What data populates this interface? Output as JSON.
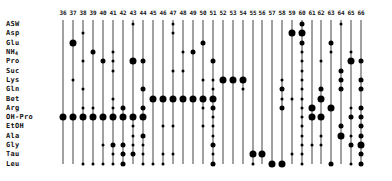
{
  "diagram": {
    "type": "dot-matrix",
    "columns": [
      "36",
      "37",
      "38",
      "39",
      "40",
      "41",
      "42",
      "43",
      "44",
      "45",
      "46",
      "47",
      "48",
      "49",
      "50",
      "51",
      "52",
      "53",
      "54",
      "55",
      "56",
      "57",
      "58",
      "59",
      "60",
      "61",
      "62",
      "63",
      "64",
      "65",
      "66"
    ],
    "rows": [
      "ASW",
      "Asp",
      "Glu",
      "NH4",
      "Pro",
      "Suc",
      "Lys",
      "Gln",
      "Bet",
      "Arg",
      "OH-Pro",
      "EtOH",
      "Ala",
      "Gly",
      "Tau",
      "Leu"
    ],
    "dot_size_legend": {
      "1": "trace",
      "2": "minor",
      "3": "major"
    },
    "dots": {
      "36": {
        "OH-Pro": 3
      },
      "37": {
        "Glu": 3,
        "Lys": 1,
        "OH-Pro": 3
      },
      "38": {
        "Asp": 1,
        "Pro": 1,
        "Gln": 1,
        "Arg": 1,
        "OH-Pro": 3,
        "Leu": 1
      },
      "39": {
        "NH4": 2,
        "Arg": 1,
        "OH-Pro": 3,
        "Leu": 1
      },
      "40": {
        "Pro": 2,
        "OH-Pro": 3,
        "Gly": 1,
        "Leu": 1
      },
      "41": {
        "NH4": 1,
        "Pro": 1,
        "Suc": 1,
        "Bet": 1,
        "Arg": 1,
        "OH-Pro": 3,
        "Gly": 2,
        "Tau": 1,
        "Leu": 1
      },
      "42": {
        "Arg": 2,
        "OH-Pro": 3,
        "Gly": 2,
        "Tau": 2,
        "Leu": 2
      },
      "43": {
        "ASW": 1,
        "Pro": 3,
        "OH-Pro": 3,
        "EtOH": 1,
        "Ala": 1,
        "Gly": 1,
        "Tau": 2
      },
      "44": {
        "Pro": 2,
        "Gln": 2,
        "Arg": 2,
        "OH-Pro": 3,
        "Ala": 2,
        "Gly": 1,
        "Tau": 1,
        "Leu": 1
      },
      "45": {
        "Bet": 3,
        "Leu": 1
      },
      "46": {
        "Bet": 3,
        "EtOH": 1,
        "Tau": 1,
        "Leu": 1
      },
      "47": {
        "ASW": 1,
        "Asp": 1,
        "Suc": 1,
        "Bet": 3,
        "EtOH": 1,
        "Tau": 1
      },
      "48": {
        "NH4": 1,
        "Suc": 1,
        "Bet": 3
      },
      "49": {
        "NH4": 2,
        "Bet": 3
      },
      "50": {
        "Glu": 2,
        "Lys": 1,
        "Bet": 3,
        "Arg": 1,
        "EtOH": 1
      },
      "51": {
        "Pro": 2,
        "Lys": 1,
        "Gln": 1,
        "Bet": 3,
        "Arg": 2,
        "OH-Pro": 1,
        "EtOH": 1,
        "Ala": 1,
        "Gly": 2,
        "Tau": 1,
        "Leu": 2
      },
      "52": {
        "Lys": 3
      },
      "53": {
        "Lys": 3
      },
      "54": {
        "Lys": 3,
        "Gln": 1
      },
      "55": {
        "Tau": 3,
        "Leu": 1
      },
      "56": {
        "Tau": 3
      },
      "57": {
        "Leu": 3
      },
      "58": {
        "Lys": 1,
        "Gln": 2,
        "Bet": 1,
        "Arg": 2,
        "Leu": 3
      },
      "59": {
        "Asp": 3,
        "Bet": 1,
        "Tau": 1
      },
      "60": {
        "ASW": 2,
        "Asp": 3,
        "Glu": 2,
        "NH4": 1,
        "Pro": 1,
        "Suc": 1,
        "Lys": 1,
        "Gln": 1,
        "Bet": 1,
        "Arg": 1,
        "OH-Pro": 1,
        "EtOH": 1,
        "Ala": 1,
        "Gly": 1,
        "Tau": 1,
        "Leu": 1
      },
      "61": {
        "Arg": 3,
        "OH-Pro": 3,
        "Gly": 1
      },
      "62": {
        "Pro": 1,
        "Gln": 2,
        "Bet": 3,
        "OH-Pro": 3,
        "Ala": 1,
        "Gly": 1
      },
      "63": {
        "Glu": 2,
        "NH4": 1,
        "Arg": 3,
        "Leu": 2
      },
      "64": {
        "ASW": 1,
        "Suc": 2,
        "Lys": 2,
        "Gln": 2,
        "EtOH": 2,
        "Ala": 3
      },
      "65": {
        "NH4": 1,
        "Pro": 3,
        "Arg": 1,
        "OH-Pro": 2,
        "Ala": 1,
        "Gly": 2,
        "Leu": 1
      },
      "66": {
        "Pro": 2,
        "Lys": 2,
        "Gln": 2,
        "Arg": 2,
        "OH-Pro": 2,
        "EtOH": 2,
        "Ala": 2,
        "Gly": 3,
        "Tau": 2,
        "Leu": 2
      }
    }
  },
  "layout": {
    "col_x": {
      "36": 63,
      "37": 73,
      "38": 83,
      "39": 93,
      "40": 103,
      "41": 113,
      "42": 123,
      "43": 133,
      "44": 143,
      "45": 153,
      "46": 163,
      "47": 173,
      "48": 183,
      "49": 193,
      "50": 203,
      "51": 213,
      "52": 223,
      "53": 233,
      "54": 243,
      "55": 253,
      "56": 262,
      "57": 272,
      "58": 282,
      "59": 292,
      "60": 302,
      "61": 312,
      "62": 321,
      "63": 331,
      "64": 341,
      "65": 351,
      "66": 361
    },
    "row_y": {
      "ASW": 24,
      "Asp": 33,
      "Glu": 43,
      "NH4": 52,
      "Pro": 61,
      "Suc": 71,
      "Lys": 80,
      "Gln": 89,
      "Bet": 99,
      "Arg": 108,
      "OH-Pro": 117,
      "EtOH": 126,
      "Ala": 136,
      "Gly": 145,
      "Tau": 154,
      "Leu": 164
    }
  }
}
